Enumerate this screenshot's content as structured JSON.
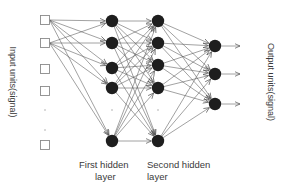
{
  "labels": {
    "input": "Input units(signal)",
    "output": "Output units(signal)",
    "hidden1_line1": "First hidden",
    "hidden1_line2": "layer",
    "hidden2_line1": "Second hidden",
    "hidden2_line2": "layer"
  },
  "colors": {
    "neuron": "#1e1e1e",
    "input_border": "#8a8a8a",
    "edge": "#555555",
    "text": "#3a3a3a"
  },
  "layers": {
    "input": {
      "x": 45,
      "units": [
        20,
        43,
        69,
        91,
        145
      ],
      "ellipsis_dots": [
        110,
        130
      ]
    },
    "hidden1": {
      "x": 112,
      "units": [
        21,
        43,
        68,
        88,
        141
      ],
      "ellipsis_dots": [
        110
      ]
    },
    "hidden2": {
      "x": 158,
      "units": [
        21,
        43,
        65,
        88,
        141
      ],
      "ellipsis_dots": [
        110
      ]
    },
    "output": {
      "x": 215,
      "units": [
        46,
        74,
        104
      ]
    }
  },
  "connections": {
    "input_to_hidden1": [
      [
        0,
        0
      ],
      [
        0,
        1
      ],
      [
        0,
        2
      ],
      [
        0,
        3
      ],
      [
        0,
        4
      ],
      [
        1,
        0
      ],
      [
        1,
        1
      ],
      [
        1,
        2
      ],
      [
        1,
        3
      ],
      [
        1,
        4
      ]
    ],
    "hidden1_to_hidden2": "all",
    "hidden2_to_output": "all"
  }
}
